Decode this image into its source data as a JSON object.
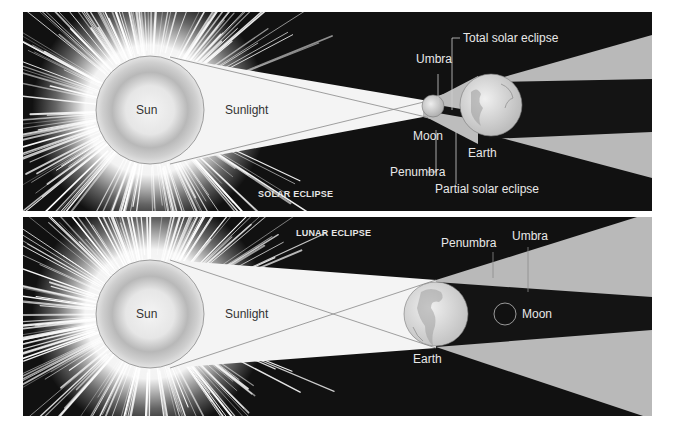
{
  "solar_eclipse": {
    "title": "SOLAR ECLIPSE",
    "labels": {
      "sun": "Sun",
      "sunlight": "Sunlight",
      "moon": "Moon",
      "earth": "Earth",
      "umbra": "Umbra",
      "penumbra": "Penumbra",
      "total": "Total solar eclipse",
      "partial": "Partial solar eclipse"
    }
  },
  "lunar_eclipse": {
    "title": "LUNAR ECLIPSE",
    "labels": {
      "sun": "Sun",
      "sunlight": "Sunlight",
      "earth": "Earth",
      "moon": "Moon",
      "umbra": "Umbra",
      "penumbra": "Penumbra"
    }
  },
  "colors": {
    "background": "#111111",
    "sunlight": "#f4f4f4",
    "penumbra": "#b9b9b9",
    "umbra": "#141414",
    "sun_body": "#d9d9d9"
  }
}
